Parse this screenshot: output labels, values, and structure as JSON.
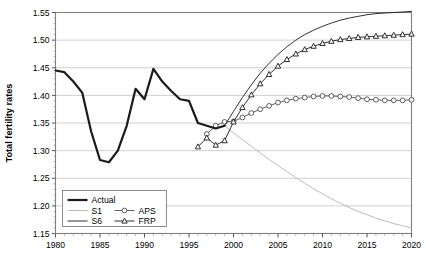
{
  "chart_data": {
    "type": "line",
    "title": "",
    "xlabel": "",
    "ylabel": "Total fertility rates",
    "xlim": [
      1980,
      2020
    ],
    "ylim": [
      1.15,
      1.55
    ],
    "grid": true,
    "grid_axis": "y",
    "legend_position": "bottom-left",
    "xticks": [
      1980,
      1985,
      1990,
      1995,
      2000,
      2005,
      2010,
      2015,
      2020
    ],
    "xtick_labels": [
      "1980",
      "1985",
      "1990",
      "1995",
      "2000",
      "2005",
      "2010",
      "2015",
      "2020"
    ],
    "yticks": [
      1.15,
      1.2,
      1.25,
      1.3,
      1.35,
      1.4,
      1.45,
      1.5,
      1.55
    ],
    "ytick_labels": [
      "1.15",
      "1.20",
      "1.25",
      "1.30",
      "1.35",
      "1.40",
      "1.45",
      "1.50",
      "1.55"
    ],
    "minor_xtick_interval": 1,
    "series": [
      {
        "name": "Actual",
        "style": "thick-solid",
        "color": "#1a1a1a",
        "marker": "none",
        "x": [
          1980,
          1981,
          1982,
          1983,
          1984,
          1985,
          1986,
          1987,
          1988,
          1989,
          1990,
          1991,
          1992,
          1993,
          1994,
          1995,
          1996,
          1997,
          1998,
          1999
        ],
        "y": [
          1.445,
          1.442,
          1.425,
          1.405,
          1.335,
          1.283,
          1.279,
          1.3,
          1.345,
          1.412,
          1.393,
          1.448,
          1.425,
          1.408,
          1.393,
          1.39,
          1.35,
          1.345,
          1.34,
          1.345
        ]
      },
      {
        "name": "S1",
        "style": "thin-solid",
        "color": "#b3b3b3",
        "marker": "none",
        "x": [
          1999,
          2000,
          2001,
          2002,
          2003,
          2004,
          2005,
          2006,
          2007,
          2008,
          2009,
          2010,
          2011,
          2012,
          2013,
          2014,
          2015,
          2016,
          2017,
          2018,
          2019,
          2020
        ],
        "y": [
          1.345,
          1.332,
          1.32,
          1.308,
          1.296,
          1.284,
          1.273,
          1.262,
          1.251,
          1.241,
          1.231,
          1.222,
          1.213,
          1.205,
          1.197,
          1.19,
          1.184,
          1.178,
          1.173,
          1.168,
          1.164,
          1.16
        ]
      },
      {
        "name": "S6",
        "style": "thin-solid",
        "color": "#1a1a1a",
        "marker": "none",
        "x": [
          1999,
          2000,
          2001,
          2002,
          2003,
          2004,
          2005,
          2006,
          2007,
          2008,
          2009,
          2010,
          2011,
          2012,
          2013,
          2014,
          2015,
          2016,
          2017,
          2018,
          2019,
          2020
        ],
        "y": [
          1.345,
          1.371,
          1.396,
          1.419,
          1.44,
          1.458,
          1.474,
          1.488,
          1.5,
          1.51,
          1.518,
          1.525,
          1.531,
          1.536,
          1.54,
          1.543,
          1.546,
          1.548,
          1.549,
          1.55,
          1.551,
          1.552
        ]
      },
      {
        "name": "APS",
        "style": "thin-solid",
        "color": "#4d4d4d",
        "marker": "open-circle",
        "x": [
          1997,
          1998,
          1999,
          2000,
          2001,
          2002,
          2003,
          2004,
          2005,
          2006,
          2007,
          2008,
          2009,
          2010,
          2011,
          2012,
          2013,
          2014,
          2015,
          2016,
          2017,
          2018,
          2019,
          2020
        ],
        "y": [
          1.33,
          1.345,
          1.352,
          1.353,
          1.36,
          1.368,
          1.375,
          1.381,
          1.387,
          1.391,
          1.394,
          1.396,
          1.398,
          1.399,
          1.399,
          1.398,
          1.397,
          1.395,
          1.393,
          1.392,
          1.391,
          1.391,
          1.391,
          1.392
        ]
      },
      {
        "name": "FRP",
        "style": "thin-solid",
        "color": "#1a1a1a",
        "marker": "open-triangle",
        "x": [
          1996,
          1997,
          1998,
          1999,
          2000,
          2001,
          2002,
          2003,
          2004,
          2005,
          2006,
          2007,
          2008,
          2009,
          2010,
          2011,
          2012,
          2013,
          2014,
          2015,
          2016,
          2017,
          2018,
          2019,
          2020
        ],
        "y": [
          1.307,
          1.323,
          1.31,
          1.318,
          1.352,
          1.378,
          1.401,
          1.421,
          1.438,
          1.453,
          1.465,
          1.475,
          1.483,
          1.489,
          1.494,
          1.498,
          1.501,
          1.503,
          1.505,
          1.506,
          1.507,
          1.508,
          1.509,
          1.51,
          1.511
        ]
      }
    ]
  },
  "legend": {
    "entries": [
      {
        "label": "Actual",
        "key": "Actual"
      },
      {
        "label": "S1",
        "key": "S1"
      },
      {
        "label": "APS",
        "key": "APS"
      },
      {
        "label": "S6",
        "key": "S6"
      },
      {
        "label": "FRP",
        "key": "FRP"
      }
    ]
  },
  "colors": {
    "actual": "#1a1a1a",
    "s1": "#b3b3b3",
    "s6": "#1a1a1a",
    "aps": "#4d4d4d",
    "frp": "#1a1a1a",
    "grid": "#d0d0d0",
    "axis": "#808080",
    "background": "#ffffff"
  }
}
